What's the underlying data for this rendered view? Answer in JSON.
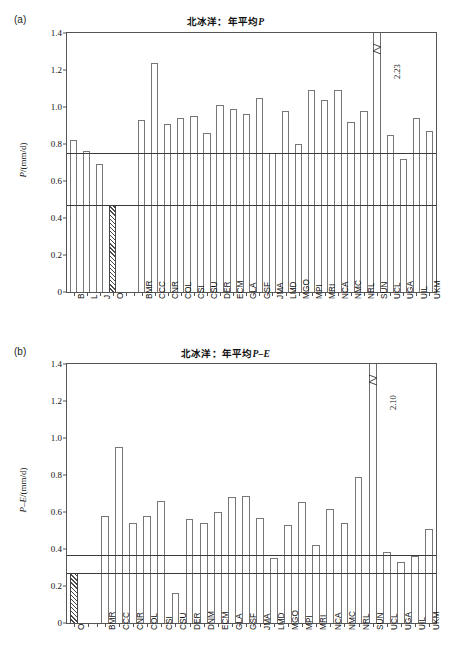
{
  "figure": {
    "panels": [
      {
        "tag": "(a)",
        "title_prefix": "北冰洋：年平均",
        "title_var": "P",
        "ylabel_var": "P",
        "ylabel_units": "/(mm/d)"
      },
      {
        "tag": "(b)",
        "title_prefix": "北冰洋：年平均",
        "title_var": "P–E",
        "ylabel_var": "P–E",
        "ylabel_units": "/(mm/d)"
      }
    ]
  },
  "chart_data": [
    {
      "type": "bar",
      "panel": "(a)",
      "title": "北冰洋：年平均P",
      "xlabel": "",
      "ylabel": "P/(mm/d)",
      "ylim": [
        0,
        1.4
      ],
      "yticks": [
        "0",
        "0.2",
        "0.4",
        "0.6",
        "0.8",
        "1.0",
        "1.2",
        "1.4"
      ],
      "ytick_values": [
        0,
        0.2,
        0.4,
        0.6,
        0.8,
        1.0,
        1.2,
        1.4
      ],
      "grid": false,
      "legend": "none",
      "reference_lines": [
        0.75,
        0.47
      ],
      "observation_categories": [
        "B",
        "L",
        "J",
        "O"
      ],
      "observation_values": [
        0.82,
        0.76,
        0.69,
        0.47
      ],
      "observation_hatched": [
        false,
        false,
        false,
        true
      ],
      "categories": [
        "BMR",
        "CCC",
        "CNR",
        "COL",
        "CSI",
        "CSU",
        "DER",
        "ECM",
        "GLA",
        "GSF",
        "JMA",
        "LMD",
        "MGO",
        "MPI",
        "MRI",
        "NCA",
        "NMC",
        "NRL",
        "SUN",
        "UCL",
        "UGA",
        "UIL",
        "UKM"
      ],
      "values": [
        0.93,
        1.24,
        0.91,
        0.94,
        0.95,
        0.86,
        1.01,
        0.99,
        0.96,
        1.05,
        0.75,
        0.98,
        0.8,
        1.09,
        1.04,
        1.09,
        0.92,
        0.98,
        2.23,
        0.85,
        0.72,
        0.94,
        0.87
      ],
      "clipped_bars": [
        {
          "category": "SUN",
          "actual_value": 2.23,
          "label": "2.23"
        }
      ]
    },
    {
      "type": "bar",
      "panel": "(b)",
      "title": "北冰洋：年平均P–E",
      "xlabel": "",
      "ylabel": "P–E/(mm/d)",
      "ylim": [
        0,
        1.4
      ],
      "yticks": [
        "0",
        "0.2",
        "0.4",
        "0.6",
        "0.8",
        "1.0",
        "1.2",
        "1.4"
      ],
      "ytick_values": [
        0,
        0.2,
        0.4,
        0.6,
        0.8,
        1.0,
        1.2,
        1.4
      ],
      "grid": false,
      "legend": "none",
      "reference_lines": [
        0.365,
        0.27
      ],
      "observation_categories": [
        "O"
      ],
      "observation_values": [
        0.27
      ],
      "observation_hatched": [
        true
      ],
      "categories": [
        "BMR",
        "CCC",
        "CNR",
        "COL",
        "CSI",
        "CSU",
        "DER",
        "DNM",
        "ECM",
        "GLA",
        "GSF",
        "JMA",
        "LMD",
        "MGO",
        "MPI",
        "MRI",
        "NCA",
        "NMC",
        "NRL",
        "SUN",
        "UCL",
        "UGA",
        "UIL",
        "UKM"
      ],
      "values": [
        0.58,
        0.95,
        0.54,
        0.58,
        0.66,
        0.16,
        0.56,
        0.54,
        0.6,
        0.68,
        0.685,
        0.57,
        0.35,
        0.53,
        0.655,
        0.42,
        0.615,
        0.54,
        0.79,
        2.1,
        0.385,
        0.33,
        0.36,
        0.51
      ],
      "clipped_bars": [
        {
          "category": "SUN",
          "actual_value": 2.1,
          "label": "2.10"
        }
      ]
    }
  ]
}
